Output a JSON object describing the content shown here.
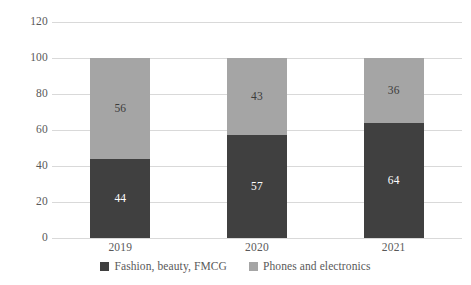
{
  "chart_data": {
    "type": "bar",
    "subtype": "stacked-bar-100-percent",
    "title": "",
    "xlabel": "",
    "ylabel": "",
    "categories": [
      "2019",
      "2020",
      "2021"
    ],
    "series": [
      {
        "name": "Fashion, beauty, FMCG",
        "color": "#404040",
        "values": [
          44,
          57,
          64
        ],
        "stack_position": "bottom"
      },
      {
        "name": "Phones and electronics",
        "color": "#a5a5a5",
        "values": [
          56,
          43,
          36
        ],
        "stack_position": "top"
      }
    ],
    "ylim": [
      0,
      120
    ],
    "yticks": [
      "0",
      "20",
      "40",
      "60",
      "80",
      "100",
      "120"
    ],
    "ytick_values": [
      0,
      20,
      40,
      60,
      80,
      100,
      120
    ],
    "grid": true,
    "grid_color": "#d9d9d9",
    "legend_position": "bottom",
    "data_labels_shown": true,
    "background_color": "#ffffff",
    "axis_text_color": "#595959"
  },
  "legend": {
    "entries": [
      {
        "label": "Fashion, beauty, FMCG",
        "swatch": "legend-swatch-fashion"
      },
      {
        "label": "Phones and electronics",
        "swatch": "legend-swatch-phones"
      }
    ]
  }
}
